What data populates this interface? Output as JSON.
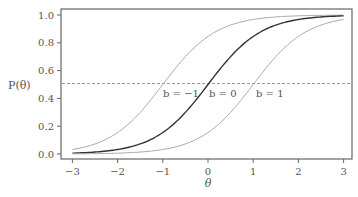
{
  "chart_data": {
    "type": "line",
    "title": "",
    "xlabel": "θ",
    "ylabel": "P(θ)",
    "xlim": [
      -3,
      3
    ],
    "ylim": [
      0.0,
      1.0
    ],
    "x_ticks": [
      "−3",
      "−2",
      "−1",
      "0",
      "1",
      "2",
      "3"
    ],
    "y_ticks": [
      "0.0",
      "0.2",
      "0.4",
      "0.6",
      "0.8",
      "1.0"
    ],
    "grid": false,
    "legend": "none",
    "model": "P(θ) = 1 / (1 + exp(-1.7 (θ - b)))",
    "reference_line": {
      "y": 0.5,
      "style": "dashed"
    },
    "x": [
      -3,
      -2.5,
      -2,
      -1.5,
      -1,
      -0.5,
      0,
      0.5,
      1,
      1.5,
      2,
      2.5,
      3
    ],
    "series": [
      {
        "name": "b = −1",
        "b": -1,
        "color": "#aaaaaa",
        "values": [
          0.032,
          0.073,
          0.154,
          0.3,
          0.5,
          0.7,
          0.846,
          0.927,
          0.968,
          0.986,
          0.994,
          0.998,
          0.999
        ]
      },
      {
        "name": "b = 0",
        "b": 0,
        "color": "#333333",
        "values": [
          0.006,
          0.014,
          0.032,
          0.073,
          0.154,
          0.3,
          0.5,
          0.7,
          0.846,
          0.927,
          0.968,
          0.986,
          0.994
        ]
      },
      {
        "name": "b = 1",
        "b": 1,
        "color": "#aaaaaa",
        "values": [
          0.001,
          0.003,
          0.006,
          0.014,
          0.032,
          0.073,
          0.154,
          0.3,
          0.5,
          0.7,
          0.846,
          0.927,
          0.968
        ]
      }
    ],
    "annotations": [
      {
        "text": "b = −1",
        "x": -1,
        "y": 0.5
      },
      {
        "text": "b = 0",
        "x": 0,
        "y": 0.5
      },
      {
        "text": "b = 1",
        "x": 1,
        "y": 0.5
      }
    ]
  },
  "labels": {
    "ylabel": "P(θ)",
    "xlabel": "θ",
    "b_neg1": "b = −1",
    "b_0": "b = 0",
    "b_1": "b = 1"
  }
}
